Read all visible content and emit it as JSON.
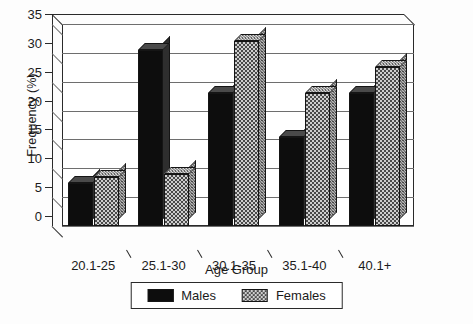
{
  "chart_data": {
    "type": "bar",
    "title": "",
    "xlabel": "Age Group",
    "ylabel": "Frequency (%)",
    "categories": [
      "20.1-25",
      "25.1-30",
      "30.1-35",
      "35.1-40",
      "40.1+"
    ],
    "series": [
      {
        "name": "Males",
        "values": [
          7.5,
          30.5,
          23.0,
          15.5,
          23.0
        ],
        "color": "#0d0d0d",
        "pattern": "solid"
      },
      {
        "name": "Females",
        "values": [
          8.5,
          9.0,
          32.0,
          23.0,
          27.5
        ],
        "color": "#9a9a9a",
        "pattern": "checkerboard"
      }
    ],
    "ylim": [
      0,
      35
    ],
    "yticks": [
      0,
      5,
      10,
      15,
      20,
      25,
      30,
      35
    ],
    "ytick_labels": [
      "0",
      "5",
      "10",
      "15",
      "20",
      "25",
      "30",
      "35"
    ],
    "grid": true,
    "grid_axis": "y",
    "legend_position": "bottom-center",
    "style": "3d-bar"
  },
  "legend": {
    "items": [
      {
        "label": "Males"
      },
      {
        "label": "Females"
      }
    ]
  },
  "axes": {
    "x_title": "Age Group",
    "y_title": "Frequency (%)"
  }
}
